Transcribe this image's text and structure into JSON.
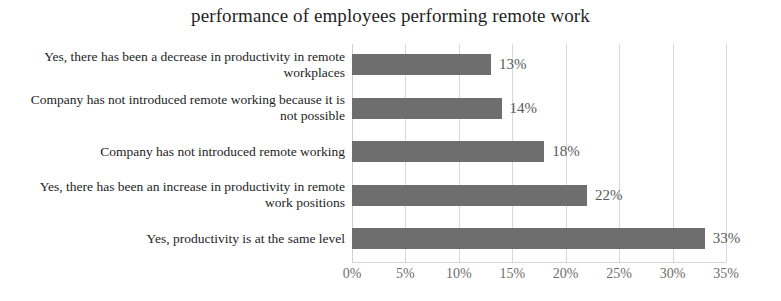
{
  "chart_data": {
    "type": "bar",
    "orientation": "horizontal",
    "title": "performance of employees performing remote work",
    "xlabel": "",
    "ylabel": "",
    "categories": [
      "Yes, there has been a decrease in productivity in remote workplaces",
      "Company has not introduced remote working because it is not possible",
      "Company has not introduced remote working",
      "Yes, there has been an increase in productivity in remote work positions",
      "Yes, productivity is at the same level"
    ],
    "values": [
      13,
      14,
      18,
      22,
      33
    ],
    "value_labels": [
      "13%",
      "14%",
      "18%",
      "22%",
      "33%"
    ],
    "xlim": [
      0,
      35
    ],
    "xticks": [
      0,
      5,
      10,
      15,
      20,
      25,
      30,
      35
    ],
    "xtick_labels": [
      "0%",
      "5%",
      "10%",
      "15%",
      "20%",
      "25%",
      "30%",
      "35%"
    ],
    "grid": "vertical",
    "legend": "none",
    "bar_color": "#6e6e6e",
    "gridline_color": "#d8d8d8",
    "value_label_color": "#5a5a5a",
    "tick_label_color": "#6d6d6d",
    "title_color": "#1f1f1f",
    "category_label_color": "#242424",
    "background_color": "#ffffff"
  }
}
